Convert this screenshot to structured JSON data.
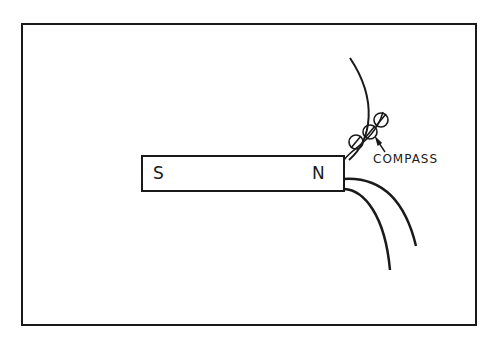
{
  "figure": {
    "type": "physics-diagram",
    "magnet": {
      "south_label": "S",
      "north_label": "N"
    },
    "annotations": {
      "compass_label": "COMPASS"
    },
    "colors": {
      "ink": "#1a1a1a",
      "background": "#ffffff"
    }
  }
}
